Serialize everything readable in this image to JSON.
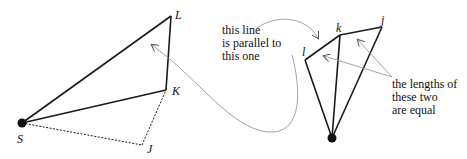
{
  "diagram": {
    "left_figure": {
      "vertices": [
        {
          "id": "S",
          "label": "S",
          "x": 22,
          "y": 123
        },
        {
          "id": "L",
          "label": "L",
          "x": 171,
          "y": 16
        },
        {
          "id": "K",
          "label": "K",
          "x": 166,
          "y": 90
        },
        {
          "id": "J",
          "label": "J",
          "x": 142,
          "y": 145
        }
      ],
      "solid_edges": [
        [
          "S",
          "L"
        ],
        [
          "L",
          "K"
        ],
        [
          "K",
          "S"
        ]
      ],
      "dashed_edges": [
        [
          "S",
          "J"
        ],
        [
          "J",
          "K"
        ]
      ]
    },
    "right_figure": {
      "vertices": [
        {
          "id": "O",
          "label": "",
          "x": 332,
          "y": 138
        },
        {
          "id": "l",
          "label": "l",
          "x": 305,
          "y": 60
        },
        {
          "id": "k",
          "label": "k",
          "x": 340,
          "y": 35
        },
        {
          "id": "j",
          "label": "j",
          "x": 382,
          "y": 27
        }
      ],
      "solid_edges": [
        [
          "O",
          "l"
        ],
        [
          "l",
          "k"
        ],
        [
          "k",
          "j"
        ],
        [
          "j",
          "O"
        ],
        [
          "O",
          "k"
        ]
      ]
    },
    "annotations": {
      "parallel_note": [
        "this line",
        "is parallel to",
        "this one"
      ],
      "equal_note": [
        "the lengths of",
        "these two",
        "are equal"
      ]
    },
    "colors": {
      "line": "#1a1a1a",
      "arrow": "#8a8a8a",
      "background": "#ffffff"
    }
  }
}
